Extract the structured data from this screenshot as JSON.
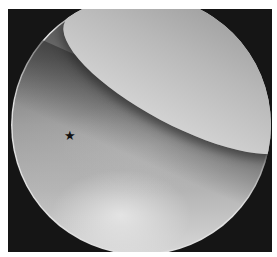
{
  "image": {
    "type": "arthroscopic view",
    "colors": {
      "background": "#ffffff",
      "frame": "#151515",
      "scope_edge": "#e0e0e0"
    },
    "annotations": [
      {
        "symbol": "★",
        "label": "star-marker",
        "x": 70,
        "y": 137
      }
    ]
  }
}
